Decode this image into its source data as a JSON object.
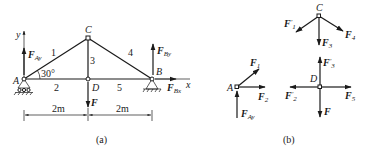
{
  "figure": {
    "panel_a": {
      "caption": "(a)",
      "axes": {
        "x_label": "x",
        "y_label": "y"
      },
      "joints": {
        "A": "A",
        "B": "B",
        "C": "C",
        "D": "D"
      },
      "members": [
        "1",
        "2",
        "3",
        "4",
        "5"
      ],
      "angle_label": "30°",
      "forces": {
        "F_Ay": {
          "main": "F",
          "sub": "Ay"
        },
        "F_By": {
          "main": "F",
          "sub": "By"
        },
        "F_Bx": {
          "main": "F",
          "sub": "Bx"
        },
        "F": {
          "main": "F",
          "sub": ""
        }
      },
      "dimensions": [
        "2m",
        "2m"
      ]
    },
    "panel_b": {
      "caption": "(b)",
      "joints": {
        "A": "A",
        "C": "C",
        "D": "D"
      },
      "forces": {
        "C_F1p": {
          "main": "F",
          "prime": "′",
          "sub": "1"
        },
        "C_F4": {
          "main": "F",
          "sub": "4"
        },
        "C_F3": {
          "main": "F",
          "sub": "3"
        },
        "A_F1": {
          "main": "F",
          "sub": "1"
        },
        "A_F2": {
          "main": "F",
          "sub": "2"
        },
        "A_FAy": {
          "main": "F",
          "sub": "Ay"
        },
        "D_F3p": {
          "main": "F",
          "prime": "′",
          "sub": "3"
        },
        "D_F2p": {
          "main": "F",
          "prime": "′",
          "sub": "2"
        },
        "D_F5": {
          "main": "F",
          "sub": "5"
        },
        "D_F": {
          "main": "F",
          "sub": ""
        }
      }
    }
  }
}
